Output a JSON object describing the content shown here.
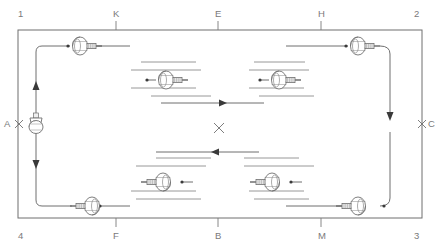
{
  "diagram": {
    "type": "engineering-schematic",
    "stroke_color": "#6f6f6f",
    "label_color": "#7a7a7a",
    "background": "#ffffff",
    "border": {
      "x": 18,
      "y": 30,
      "width": 404,
      "height": 188
    }
  },
  "grid_labels": {
    "top": [
      {
        "text": "1",
        "x": 20,
        "y": 12,
        "tick": false
      },
      {
        "text": "K",
        "x": 116,
        "y": 12,
        "tick": true
      },
      {
        "text": "E",
        "x": 218,
        "y": 12,
        "tick": true
      },
      {
        "text": "H",
        "x": 321,
        "y": 12,
        "tick": true
      },
      {
        "text": "2",
        "x": 416,
        "y": 12,
        "tick": false
      }
    ],
    "bottom": [
      {
        "text": "4",
        "x": 20,
        "y": 233,
        "tick": false
      },
      {
        "text": "F",
        "x": 116,
        "y": 233,
        "tick": true
      },
      {
        "text": "B",
        "x": 218,
        "y": 233,
        "tick": true
      },
      {
        "text": "M",
        "x": 321,
        "y": 233,
        "tick": true
      },
      {
        "text": "3",
        "x": 416,
        "y": 233,
        "tick": false
      }
    ],
    "left": [
      {
        "text": "A",
        "x": 5,
        "y": 120
      }
    ],
    "right": [
      {
        "text": "C",
        "x": 428,
        "y": 120
      }
    ]
  },
  "reference_marks": [
    {
      "name": "mark-a",
      "x": 19,
      "y": 124,
      "size": 4
    },
    {
      "name": "mark-c",
      "x": 422,
      "y": 124,
      "size": 4
    },
    {
      "name": "mark-center",
      "x": 219,
      "y": 128,
      "size": 5
    }
  ],
  "valves": [
    {
      "name": "valve-top-left",
      "x": 80,
      "y": 44,
      "facing": "right",
      "dot": "left"
    },
    {
      "name": "valve-top-right",
      "x": 358,
      "y": 44,
      "facing": "right",
      "dot": "left"
    },
    {
      "name": "valve-bottom-left",
      "x": 84,
      "y": 208,
      "facing": "left",
      "dot": "right"
    },
    {
      "name": "valve-bottom-right",
      "x": 358,
      "y": 208,
      "facing": "left",
      "dot": "right"
    },
    {
      "name": "valve-inner-upper-left",
      "x": 166,
      "y": 78,
      "facing": "right",
      "dot": "left"
    },
    {
      "name": "valve-inner-upper-right",
      "x": 279,
      "y": 78,
      "facing": "right",
      "dot": "left"
    },
    {
      "name": "valve-inner-lower-left",
      "x": 163,
      "y": 180,
      "facing": "left",
      "dot": "right"
    },
    {
      "name": "valve-inner-lower-right",
      "x": 272,
      "y": 180,
      "facing": "left",
      "dot": "right"
    }
  ],
  "pump": {
    "name": "pump-assembly-a",
    "x": 36,
    "y": 124
  },
  "flow_arrows": [
    {
      "name": "flow-arrow-center-right",
      "x": 224,
      "y": 103,
      "direction": "right"
    },
    {
      "name": "flow-arrow-center-left",
      "x": 214,
      "y": 152,
      "direction": "left"
    },
    {
      "name": "flow-arrow-riser-up",
      "x": 36,
      "y": 82,
      "direction": "up"
    },
    {
      "name": "flow-arrow-riser-down",
      "x": 36,
      "y": 168,
      "direction": "down"
    },
    {
      "name": "flow-arrow-right-down",
      "x": 403,
      "y": 120,
      "direction": "down"
    }
  ],
  "detail_lines": [
    {
      "name": "detail-line-1",
      "x1": 141,
      "y1": 62,
      "x2": 196,
      "y2": 62
    },
    {
      "name": "detail-line-2",
      "x1": 131,
      "y1": 70,
      "x2": 201,
      "y2": 70
    },
    {
      "name": "detail-line-3",
      "x1": 131,
      "y1": 88,
      "x2": 196,
      "y2": 88
    },
    {
      "name": "detail-line-4",
      "x1": 151,
      "y1": 96,
      "x2": 211,
      "y2": 96
    },
    {
      "name": "detail-line-5",
      "x1": 254,
      "y1": 62,
      "x2": 305,
      "y2": 62
    },
    {
      "name": "detail-line-6",
      "x1": 249,
      "y1": 70,
      "x2": 309,
      "y2": 70
    },
    {
      "name": "detail-line-7",
      "x1": 249,
      "y1": 88,
      "x2": 304,
      "y2": 88
    },
    {
      "name": "detail-line-8",
      "x1": 259,
      "y1": 96,
      "x2": 314,
      "y2": 96
    },
    {
      "name": "detail-line-9",
      "x1": 156,
      "y1": 158,
      "x2": 211,
      "y2": 158
    },
    {
      "name": "detail-line-10",
      "x1": 136,
      "y1": 166,
      "x2": 206,
      "y2": 166
    },
    {
      "name": "detail-line-11",
      "x1": 131,
      "y1": 191,
      "x2": 196,
      "y2": 191
    },
    {
      "name": "detail-line-12",
      "x1": 136,
      "y1": 199,
      "x2": 201,
      "y2": 199
    },
    {
      "name": "detail-line-13",
      "x1": 244,
      "y1": 158,
      "x2": 299,
      "y2": 158
    },
    {
      "name": "detail-line-14",
      "x1": 244,
      "y1": 166,
      "x2": 314,
      "y2": 166
    },
    {
      "name": "detail-line-15",
      "x1": 249,
      "y1": 191,
      "x2": 304,
      "y2": 191
    },
    {
      "name": "detail-line-16",
      "x1": 254,
      "y1": 199,
      "x2": 309,
      "y2": 199
    }
  ],
  "flow_segments": [
    {
      "name": "flow-line-center-upper",
      "x1": 161,
      "y1": 103,
      "x2": 264,
      "y2": 103
    },
    {
      "name": "flow-line-center-lower",
      "x1": 156,
      "y1": 152,
      "x2": 259,
      "y2": 152
    }
  ]
}
